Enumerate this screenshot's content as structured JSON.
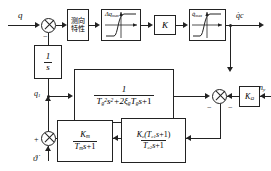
{
  "diagram": {
    "type": "control-block-diagram",
    "stroke_color": "#222222",
    "background_color": "#ffffff",
    "signals": {
      "input_q": "q",
      "output_qdot_c": "q̇c",
      "integrator_output_q1": "q1",
      "disturbance_n": "ny",
      "body_rate": "ϑ̇"
    },
    "blocks": {
      "direction_finder": {
        "label": "测向特性",
        "line1": "测向",
        "line2": "特性"
      },
      "limiter_dq": {
        "label": "Δqmax",
        "label_base": "Δq",
        "label_sub": "max",
        "kind": "saturation"
      },
      "gain_K": {
        "label": "K"
      },
      "limiter_qdot": {
        "label": "q̇max",
        "label_base": "q̇",
        "label_sub": "max",
        "kind": "saturation"
      },
      "integrator": {
        "numerator": "1",
        "denominator": "s"
      },
      "second_order": {
        "numerator": "1",
        "denominator_T": "T",
        "denominator_sub": "g",
        "denominator_full": "Tg²s²+2ξg Tg s+1"
      },
      "lead_lag": {
        "numerator": "Kc(Tc1s+1)",
        "denominator": "Tc2s+1"
      },
      "motor": {
        "numerator": "Km",
        "denominator": "Tms+1"
      },
      "gain_Komega": {
        "label": "KΩ"
      }
    },
    "sum_signs": {
      "input_sum_minus": "−",
      "right_sum_minus_left": "−",
      "right_sum_minus_right": "−",
      "bottom_sum_plus": "+"
    }
  }
}
